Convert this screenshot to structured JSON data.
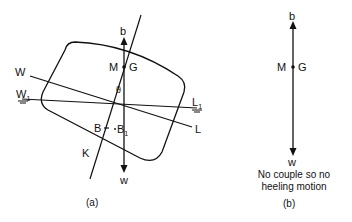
{
  "figure_a": {
    "caption": "(a)",
    "labels": {
      "b": "b",
      "M": "M",
      "G": "G",
      "theta": "θ",
      "W": "W",
      "L": "L",
      "W1_main": "W",
      "W1_sub": "1",
      "L1_main": "L",
      "L1_sub": "1",
      "B": "B",
      "B1_main": "B",
      "B1_sub": "1",
      "K": "K",
      "w": "w"
    }
  },
  "figure_b": {
    "caption": "(b)",
    "labels": {
      "b": "b",
      "M": "M",
      "G": "G",
      "w": "w"
    },
    "note_line1": "No couple so no",
    "note_line2": "heeling motion"
  },
  "colors": {
    "line": "#111111",
    "background": "#ffffff"
  }
}
